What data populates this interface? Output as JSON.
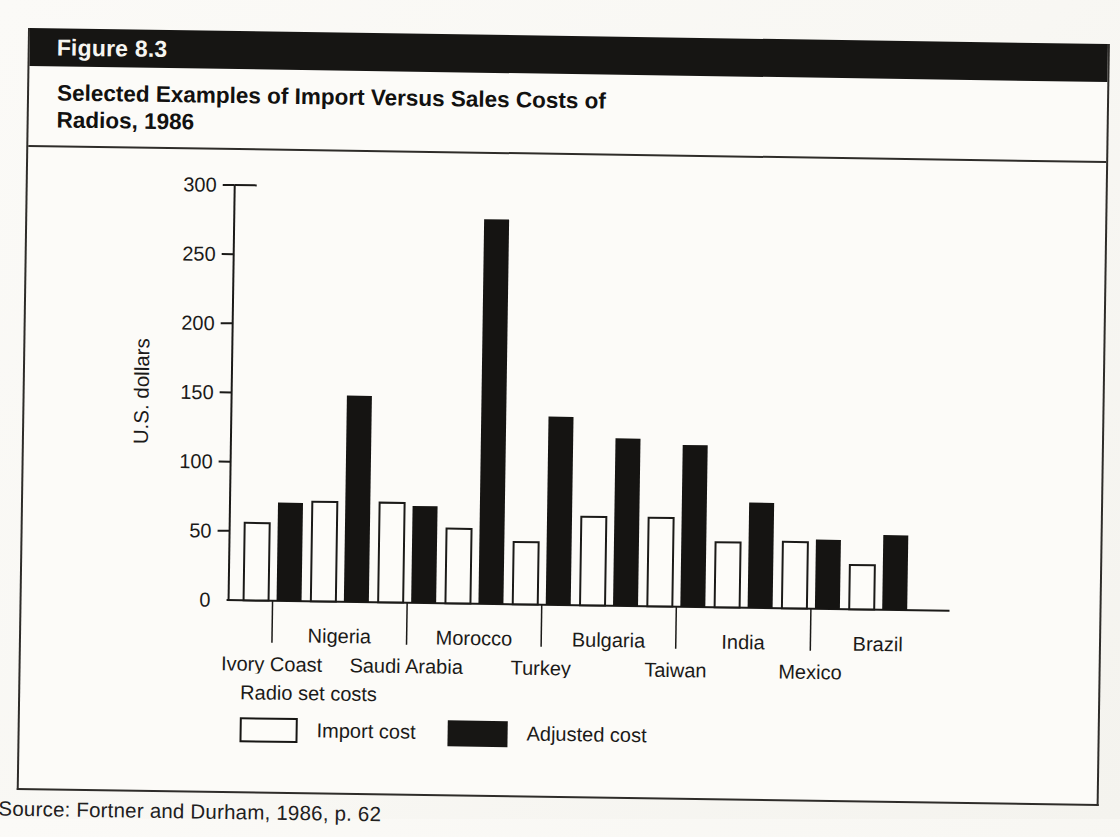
{
  "figure": {
    "label": "Figure 8.3",
    "title_line1": "Selected Examples of Import Versus Sales Costs of",
    "title_line2": "Radios, 1986",
    "source": "Source: Fortner and Durham, 1986, p. 62"
  },
  "legend": {
    "heading": "Radio set costs",
    "import_label": "Import cost",
    "adjusted_label": "Adjusted cost"
  },
  "colors": {
    "ink": "#1b1a18",
    "bar_black": "#151412",
    "bar_white": "#fdfcf9",
    "header_bg": "#161513",
    "header_text": "#f6f5f1",
    "paper": "#fcfbf8"
  },
  "chart_data": {
    "type": "bar",
    "title": "Selected Examples of Import Versus Sales Costs of Radios, 1986",
    "xlabel": "",
    "ylabel": "U.S. dollars",
    "ylim": [
      0,
      300
    ],
    "yticks": [
      0,
      50,
      100,
      150,
      200,
      250,
      300
    ],
    "grid": false,
    "legend_position": "below",
    "categories": [
      "Ivory Coast",
      "Nigeria",
      "Saudi Arabia",
      "Morocco",
      "Turkey",
      "Bulgaria",
      "Taiwan",
      "India",
      "Mexico",
      "Brazil"
    ],
    "series": [
      {
        "name": "Import cost",
        "color": "#fdfcf9",
        "values": [
          56,
          72,
          72,
          54,
          45,
          64,
          64,
          47,
          48,
          32
        ]
      },
      {
        "name": "Adjusted cost",
        "color": "#151412",
        "values": [
          71,
          149,
          70,
          278,
          136,
          121,
          117,
          76,
          50,
          54
        ]
      }
    ],
    "x_label_rows": {
      "upper": [
        "Nigeria",
        "Morocco",
        "Bulgaria",
        "India",
        "Brazil"
      ],
      "lower": [
        "Ivory Coast",
        "Saudi Arabia",
        "Turkey",
        "Taiwan",
        "Mexico"
      ]
    }
  }
}
